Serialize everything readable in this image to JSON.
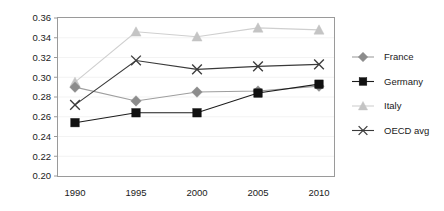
{
  "chart_data": {
    "type": "line",
    "title": "",
    "xlabel": "",
    "ylabel": "",
    "categories": [
      "1990",
      "1995",
      "2000",
      "2005",
      "2010"
    ],
    "x": [
      1990,
      1995,
      2000,
      2005,
      2010
    ],
    "ylim": [
      0.2,
      0.36
    ],
    "y_ticks": [
      "0.20",
      "0.22",
      "0.24",
      "0.26",
      "0.28",
      "0.30",
      "0.32",
      "0.34",
      "0.36"
    ],
    "y_tick_values": [
      0.2,
      0.22,
      0.24,
      0.26,
      0.28,
      0.3,
      0.32,
      0.34,
      0.36
    ],
    "grid": true,
    "legend_position": "right",
    "series": [
      {
        "name": "France",
        "marker": "diamond",
        "color": "#8c8c8c",
        "line_color": "#9e9e9e",
        "values": [
          0.29,
          0.276,
          0.285,
          0.286,
          0.291
        ]
      },
      {
        "name": "Germany",
        "marker": "square",
        "color": "#111111",
        "line_color": "#1c1c1c",
        "values": [
          0.254,
          0.264,
          0.264,
          0.284,
          0.293
        ]
      },
      {
        "name": "Italy",
        "marker": "triangle",
        "color": "#c4c4c4",
        "line_color": "#cfcfcf",
        "values": [
          0.295,
          0.346,
          0.341,
          0.35,
          0.348
        ]
      },
      {
        "name": "OECD avg",
        "marker": "x",
        "color": "#3a3a3a",
        "line_color": "#3a3a3a",
        "values": [
          0.272,
          0.317,
          0.308,
          0.311,
          0.313
        ]
      }
    ]
  },
  "legend": {
    "items": [
      {
        "label": "France"
      },
      {
        "label": "Germany"
      },
      {
        "label": "Italy"
      },
      {
        "label": "OECD avg"
      }
    ]
  },
  "axes": {
    "x_tick_labels": [
      "1990",
      "1995",
      "2000",
      "2005",
      "2010"
    ],
    "y_tick_labels": [
      "0.36",
      "0.34",
      "0.32",
      "0.30",
      "0.28",
      "0.26",
      "0.24",
      "0.22",
      "0.20"
    ]
  }
}
